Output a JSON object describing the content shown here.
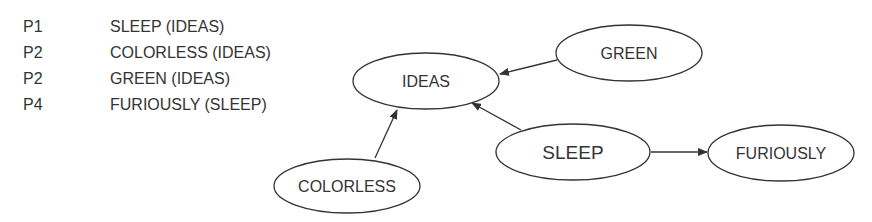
{
  "rules": [
    {
      "label": "P1",
      "text": "SLEEP (IDEAS)"
    },
    {
      "label": "P2",
      "text": "COLORLESS (IDEAS)"
    },
    {
      "label": "P2",
      "text": "GREEN (IDEAS)"
    },
    {
      "label": "P4",
      "text": "FURIOUSLY (SLEEP)"
    }
  ],
  "nodes": {
    "ideas": {
      "label": "IDEAS"
    },
    "green": {
      "label": "GREEN"
    },
    "sleep": {
      "label": "SLEEP"
    },
    "furiously": {
      "label": "FURIOUSLY"
    },
    "colorless": {
      "label": "COLORLESS"
    }
  },
  "edges": [
    {
      "from": "GREEN",
      "to": "IDEAS"
    },
    {
      "from": "COLORLESS",
      "to": "IDEAS"
    },
    {
      "from": "SLEEP",
      "to": "IDEAS"
    },
    {
      "from": "SLEEP",
      "to": "FURIOUSLY"
    }
  ],
  "colors": {
    "stroke": "#333333",
    "text": "#333333",
    "background": "#ffffff"
  }
}
